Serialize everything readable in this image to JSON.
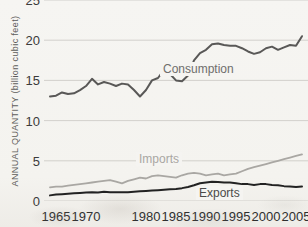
{
  "chart_data": {
    "type": "line",
    "title": "",
    "subtitle": "",
    "xlabel": "",
    "ylabel": "ANNUAL QUANTITY (billion cubic feet)",
    "xlim": [
      1963,
      2007
    ],
    "ylim": [
      0,
      25
    ],
    "grid": true,
    "grid_axis": "y",
    "legend_position": "inline-on-plot",
    "y_ticks": [
      0,
      5,
      10,
      15,
      20,
      25
    ],
    "y_tick_labels": [
      "0",
      "5",
      "10",
      "15",
      "20",
      "25"
    ],
    "x_ticks": [
      1965,
      1970,
      1980,
      1985,
      1990,
      1995,
      2000,
      2005
    ],
    "x_tick_labels": [
      "1965",
      "1970",
      "1980",
      "1985",
      "1990",
      "1995",
      "2000",
      "2005"
    ],
    "x": [
      1964,
      1965,
      1966,
      1967,
      1968,
      1969,
      1970,
      1971,
      1972,
      1973,
      1974,
      1975,
      1976,
      1977,
      1978,
      1979,
      1980,
      1981,
      1982,
      1983,
      1984,
      1985,
      1986,
      1987,
      1988,
      1989,
      1990,
      1991,
      1992,
      1993,
      1994,
      1995,
      1996,
      1997,
      1998,
      1999,
      2000,
      2001,
      2002,
      2003,
      2004,
      2005,
      2006
    ],
    "series": [
      {
        "name": "Consumption",
        "color": "#595857",
        "values": [
          13.0,
          13.1,
          13.5,
          13.3,
          13.4,
          13.8,
          14.3,
          15.2,
          14.5,
          14.8,
          14.6,
          14.3,
          14.6,
          14.5,
          13.8,
          13.0,
          13.8,
          15.0,
          15.3,
          16.3,
          15.8,
          15.0,
          14.9,
          15.6,
          17.5,
          18.4,
          18.8,
          19.5,
          19.6,
          19.4,
          19.3,
          19.3,
          19.0,
          18.6,
          18.3,
          18.5,
          19.0,
          19.2,
          18.8,
          19.1,
          19.4,
          19.3,
          20.5
        ],
        "label_on_plot": "Consumption"
      },
      {
        "name": "Imports",
        "color": "#a9a7a3",
        "values": [
          1.7,
          1.8,
          1.8,
          1.9,
          2.0,
          2.1,
          2.2,
          2.3,
          2.4,
          2.5,
          2.6,
          2.4,
          2.2,
          2.5,
          2.7,
          2.9,
          2.8,
          3.1,
          3.2,
          3.1,
          3.0,
          2.9,
          3.2,
          3.4,
          3.5,
          3.4,
          3.2,
          3.3,
          3.4,
          3.2,
          3.3,
          3.4,
          3.7,
          4.0,
          4.2,
          4.4,
          4.6,
          4.8,
          5.0,
          5.2,
          5.4,
          5.6,
          5.8
        ],
        "label_on_plot": "Imports"
      },
      {
        "name": "Exports",
        "color": "#222222",
        "values": [
          0.7,
          0.8,
          0.85,
          0.9,
          0.95,
          1.0,
          1.05,
          1.1,
          1.05,
          1.15,
          1.1,
          1.1,
          1.1,
          1.1,
          1.15,
          1.2,
          1.25,
          1.3,
          1.35,
          1.4,
          1.45,
          1.5,
          1.6,
          1.75,
          1.95,
          2.2,
          2.3,
          2.4,
          2.35,
          2.3,
          2.3,
          2.2,
          2.1,
          2.1,
          2.0,
          2.1,
          2.1,
          2.0,
          1.95,
          1.85,
          1.8,
          1.75,
          1.8
        ],
        "label_on_plot": "Exports"
      }
    ]
  }
}
